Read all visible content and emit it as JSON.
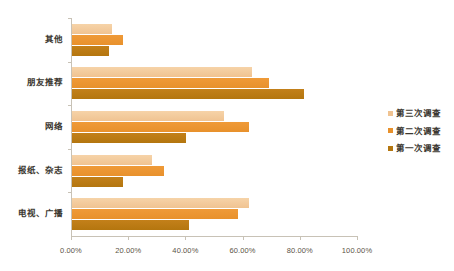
{
  "chart_data": {
    "type": "bar",
    "orientation": "horizontal",
    "title": "",
    "subtitle": "",
    "xlabel": "",
    "ylabel": "",
    "xlim": [
      0,
      100
    ],
    "xticks": [
      "0.00%",
      "20.00%",
      "40.00%",
      "60.00%",
      "80.00%",
      "100.00%"
    ],
    "xtick_values": [
      0,
      20,
      40,
      60,
      80,
      100
    ],
    "grid": false,
    "legend_position": "right",
    "categories": [
      "其他",
      "朋友推荐",
      "网络",
      "报纸、杂志",
      "电视、广播"
    ],
    "series": [
      {
        "name": "第三次调查",
        "color": "#f0c391",
        "values": [
          14,
          63,
          53,
          28,
          62
        ]
      },
      {
        "name": "第二次调查",
        "color": "#e8912c",
        "values": [
          18,
          69,
          62,
          32,
          58
        ]
      },
      {
        "name": "第一次调查",
        "color": "#b4760f",
        "values": [
          13,
          81,
          40,
          18,
          41
        ]
      }
    ]
  },
  "axis": {
    "line_color": "#c8c2b6"
  }
}
